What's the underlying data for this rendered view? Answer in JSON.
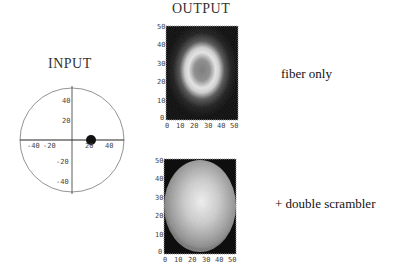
{
  "input": {
    "title": "INPUT",
    "x_ticks": [
      "-40",
      "-20",
      "20",
      "40"
    ],
    "y_ticks": [
      "40",
      "20",
      "-20",
      "-40"
    ],
    "spot": {
      "x": 20,
      "y": 0
    }
  },
  "output": {
    "title": "OUTPUT",
    "plots": [
      {
        "label": "fiber only",
        "pattern": "ring",
        "x_ticks": [
          "0",
          "10",
          "20",
          "30",
          "40",
          "50"
        ],
        "y_ticks": [
          "50",
          "40",
          "30",
          "20",
          "10",
          "0"
        ]
      },
      {
        "label": "+ double scrambler",
        "pattern": "disk",
        "x_ticks": [
          "0",
          "10",
          "20",
          "30",
          "40",
          "50"
        ],
        "y_ticks": [
          "50",
          "40",
          "30",
          "20",
          "10",
          "0"
        ]
      }
    ]
  }
}
